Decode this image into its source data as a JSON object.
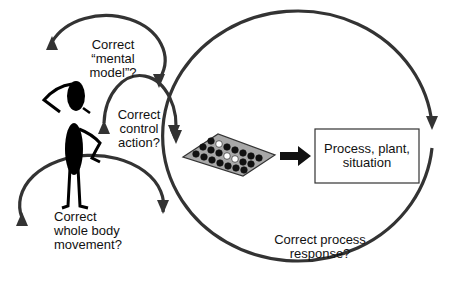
{
  "diagram": {
    "loops": {
      "mental_model": {
        "lines": [
          "Correct",
          "“mental",
          "model”?"
        ]
      },
      "control_action": {
        "lines": [
          "Correct",
          "control",
          "action?"
        ]
      },
      "body_movement": {
        "lines": [
          "Correct",
          "whole body",
          "movement?"
        ]
      },
      "process_response": {
        "lines": [
          "Correct process",
          "response?"
        ]
      }
    },
    "process_box": {
      "lines": [
        "Process, plant,",
        "situation"
      ]
    },
    "icons": {
      "operator": "thinking-person-icon",
      "control_panel": "control-panel-icon",
      "arrow": "right-arrow-icon"
    },
    "colors": {
      "loop_stroke": "#333333",
      "panel_fill": "#a8a8a8",
      "knob_dark": "#111111",
      "knob_light": "#ffffff",
      "figure": "#000000"
    }
  }
}
